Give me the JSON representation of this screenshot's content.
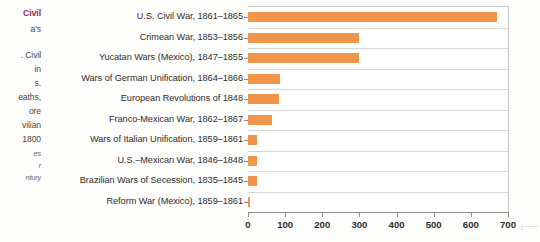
{
  "margin_column": {
    "lines": [
      {
        "text": "Civil",
        "style": "head"
      },
      {
        "text": "a’s",
        "style": "body"
      },
      {
        "text": ". Civil",
        "style": "body"
      },
      {
        "text": "in",
        "style": "body"
      },
      {
        "text": "s.",
        "style": "body"
      },
      {
        "text": "eaths,",
        "style": "body"
      },
      {
        "text": "ore",
        "style": "body"
      },
      {
        "text": "vilian",
        "style": "body"
      },
      {
        "text": "1800",
        "style": "body"
      },
      {
        "text": "es",
        "style": "cap"
      },
      {
        "text": "r",
        "style": "cap"
      },
      {
        "text": "ntury",
        "style": "cap"
      }
    ]
  },
  "chart_data": {
    "type": "bar",
    "orientation": "horizontal",
    "title": "",
    "subtitle": "",
    "xlabel": "",
    "ylabel": "",
    "xlim": [
      0,
      700
    ],
    "xticks": [
      0,
      100,
      200,
      300,
      400,
      500,
      600,
      700
    ],
    "grid": true,
    "grid_axis": "y",
    "legend": false,
    "bar_color": "#f0954a",
    "axis_color": "#8a8a8a",
    "grid_color": "#d6d6d6",
    "categories": [
      "U.S. Civil War, 1861–1865",
      "Crimean War, 1853–1856",
      "Yucatan Wars (Mexico), 1847–1855",
      "Wars of German Unification, 1864–1866",
      "European Revolutions of 1848",
      "Franco-Mexican War, 1862–1867",
      "Wars of Italian Unification, 1859–1861",
      "U.S.–Mexican War, 1846–1848",
      "Brazilian Wars of Secession, 1835–1845",
      "Reform War (Mexico), 1859–1861"
    ],
    "values": [
      670,
      300,
      298,
      85,
      83,
      65,
      25,
      25,
      25,
      6
    ]
  },
  "corner_mark": "┌──"
}
